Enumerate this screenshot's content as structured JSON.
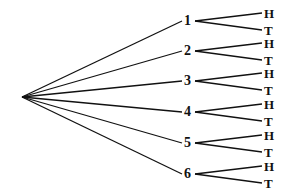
{
  "diagram": {
    "type": "tree",
    "root": {
      "x": 22,
      "y": 97
    },
    "stroke_color": "#111111",
    "branches": [
      {
        "label": "1",
        "y": 21,
        "outcomes": [
          {
            "label": "H",
            "y": 13
          },
          {
            "label": "T",
            "y": 30
          }
        ]
      },
      {
        "label": "2",
        "y": 51,
        "outcomes": [
          {
            "label": "H",
            "y": 43
          },
          {
            "label": "T",
            "y": 60
          }
        ]
      },
      {
        "label": "3",
        "y": 81,
        "outcomes": [
          {
            "label": "H",
            "y": 73
          },
          {
            "label": "T",
            "y": 90
          }
        ]
      },
      {
        "label": "4",
        "y": 112,
        "outcomes": [
          {
            "label": "H",
            "y": 104
          },
          {
            "label": "T",
            "y": 121
          }
        ]
      },
      {
        "label": "5",
        "y": 143,
        "outcomes": [
          {
            "label": "H",
            "y": 135
          },
          {
            "label": "T",
            "y": 152
          }
        ]
      },
      {
        "label": "6",
        "y": 174,
        "outcomes": [
          {
            "label": "H",
            "y": 166
          },
          {
            "label": "T",
            "y": 183
          }
        ]
      }
    ]
  }
}
